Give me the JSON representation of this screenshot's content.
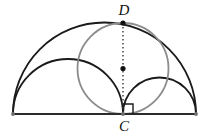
{
  "figure": {
    "type": "geometry-diagram",
    "canvas": {
      "width": 207,
      "height": 137
    },
    "colors": {
      "stroke_dark": "#1a1a1a",
      "stroke_gray": "#8c8c8c",
      "baseline": "#2b2b2b",
      "label": "#111111",
      "background": "#ffffff"
    },
    "labels": [
      {
        "id": "label-D",
        "text": "D",
        "x": 124,
        "y": 15,
        "anchor": "middle"
      },
      {
        "id": "label-C",
        "text": "C",
        "x": 124,
        "y": 131,
        "anchor": "middle"
      }
    ],
    "points": {
      "A": {
        "x": 13,
        "y": 114
      },
      "B": {
        "x": 196,
        "y": 114
      },
      "C": {
        "x": 123,
        "y": 114
      },
      "D": {
        "x": 123,
        "y": 23
      },
      "center_CD": {
        "x": 123,
        "y": 68.5
      }
    },
    "baseline": {
      "x1": 13,
      "y1": 114,
      "x2": 196,
      "y2": 114,
      "width": 2.2
    },
    "arcs": [
      {
        "id": "semicircle-AB",
        "label": "large semicircle on AB",
        "cx": 104.5,
        "cy": 114,
        "r": 91.5,
        "color": "#1a1a1a",
        "width": 1.8
      },
      {
        "id": "semicircle-AC",
        "label": "semicircle on AC",
        "cx": 68,
        "cy": 114,
        "r": 55,
        "color": "#1a1a1a",
        "width": 1.8
      },
      {
        "id": "semicircle-CB",
        "label": "semicircle on CB",
        "cx": 159.5,
        "cy": 114,
        "r": 36.5,
        "color": "#1a1a1a",
        "width": 1.8
      }
    ],
    "circle": {
      "id": "circle-on-CD",
      "label": "circle with diameter CD",
      "cx": 123,
      "cy": 68.5,
      "r": 45.5,
      "color": "#8c8c8c",
      "width": 1.8
    },
    "dotted_segment": {
      "id": "segment-CD",
      "x1": 123,
      "y1": 23,
      "x2": 123,
      "y2": 114,
      "color": "#3a3a3a",
      "width": 1.4,
      "dash": "1.6 2.4"
    },
    "dots": [
      {
        "id": "dot-D",
        "x": 123,
        "y": 23,
        "r": 2.6
      },
      {
        "id": "dot-center",
        "x": 123,
        "y": 68.5,
        "r": 2.6
      },
      {
        "id": "dot-A",
        "x": 13,
        "y": 114,
        "r": 1.9
      },
      {
        "id": "dot-B",
        "x": 196,
        "y": 114,
        "r": 1.9
      },
      {
        "id": "dot-C",
        "x": 123,
        "y": 114,
        "r": 1.9
      }
    ],
    "right_angle_marker": {
      "id": "right-angle-at-C",
      "points": "123,104 133,104 133,114",
      "size": 10,
      "color": "#1a1a1a",
      "width": 1.4
    }
  }
}
